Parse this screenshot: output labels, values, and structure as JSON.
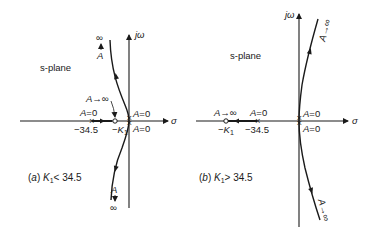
{
  "diagram": {
    "type": "root-locus",
    "panels": [
      {
        "id": "a",
        "caption_prefix": "(a)",
        "caption_var": "K",
        "caption_sub": "1",
        "caption_rest": "< 34.5",
        "plane_label": "s-plane",
        "axis_vertical": "jω",
        "axis_horizontal": "σ",
        "pole_label": "−34.5",
        "pole_gain": "A=0",
        "zero_label": "−K",
        "zero_sub": "1",
        "zero_gain": "A→∞",
        "origin_upper": "A=0",
        "origin_lower": "A=0",
        "upper_end_A": "A",
        "upper_end_inf": "∞",
        "lower_end_A": "A",
        "lower_end_inf": "∞"
      },
      {
        "id": "b",
        "caption_prefix": "(b)",
        "caption_var": "K",
        "caption_sub": "1",
        "caption_rest": "> 34.5",
        "plane_label": "s-plane",
        "axis_vertical": "jω",
        "axis_horizontal": "σ",
        "pole_label": "−34.5",
        "pole_gain": "A=0",
        "zero_label": "−K",
        "zero_sub": "1",
        "zero_gain": "A→∞",
        "origin_upper": "A=0",
        "origin_lower": "A=0",
        "upper_end": "A→∞",
        "lower_end": "A→∞"
      }
    ]
  }
}
